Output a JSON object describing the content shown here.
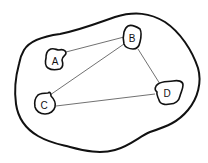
{
  "diagram": {
    "type": "graph",
    "boundary": "region",
    "nodes": [
      {
        "id": "A",
        "label": "A"
      },
      {
        "id": "B",
        "label": "B"
      },
      {
        "id": "C",
        "label": "C"
      },
      {
        "id": "D",
        "label": "D"
      }
    ],
    "edges": [
      {
        "from": "A",
        "to": "B"
      },
      {
        "from": "B",
        "to": "C"
      },
      {
        "from": "B",
        "to": "D"
      },
      {
        "from": "C",
        "to": "D"
      }
    ],
    "colors": {
      "stroke": "#111111",
      "edge": "#333333",
      "background": "#ffffff"
    }
  }
}
